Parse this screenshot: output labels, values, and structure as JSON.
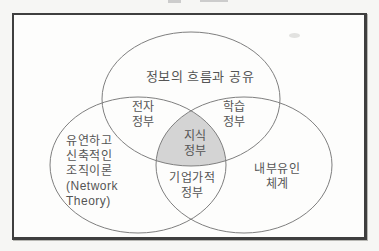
{
  "venn": {
    "circles": {
      "top": {
        "label": "정보의 흐름과 공유"
      },
      "left": {
        "lines": [
          "유연하고",
          "신축적인",
          "조직이론",
          "(Network",
          "Theory)"
        ]
      },
      "right": {
        "lines": [
          "내부유인",
          "체계"
        ]
      }
    },
    "overlaps": {
      "top_left": {
        "lines": [
          "전자",
          "정부"
        ]
      },
      "top_right": {
        "lines": [
          "학습",
          "정부"
        ]
      },
      "bottom": {
        "lines": [
          "기업가적",
          "정부"
        ]
      },
      "center": {
        "lines": [
          "지식",
          "정부"
        ]
      }
    },
    "colors": {
      "center_fill": "#d4d4d4",
      "circle_stroke": "#7f7f7f",
      "text": "#555555",
      "frame_border": "#3f3f3f"
    }
  }
}
